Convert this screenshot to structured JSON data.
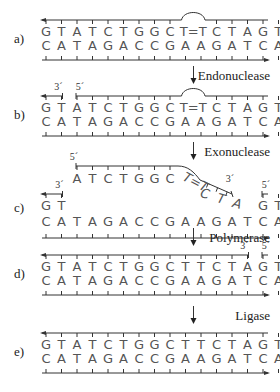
{
  "figure": {
    "column_start_x": 46,
    "column_spacing": 15.5,
    "colors": {
      "text": "#555555",
      "line": "#333333",
      "label": "#222222"
    },
    "panels": [
      {
        "id": "a",
        "label": "a)",
        "y_top": 20,
        "top_strand": [
          "G",
          "T",
          "A",
          "T",
          "C",
          "T",
          "G",
          "G",
          "C",
          "T",
          "T",
          "C",
          "T",
          "A",
          "G",
          "T"
        ],
        "top_display": "G T A T C T G G C T=T C T A G T",
        "bottom_strand": [
          "C",
          "A",
          "T",
          "A",
          "G",
          "A",
          "C",
          "C",
          "G",
          "A",
          "A",
          "G",
          "A",
          "T",
          "C",
          "A"
        ],
        "dimer": {
          "between_columns": [
            9,
            10
          ],
          "text": "T=T"
        },
        "top_nicks": [],
        "end_labels": []
      },
      {
        "id": "b",
        "label": "b)",
        "y_top": 96,
        "top_strand": [
          "G",
          "T",
          "A",
          "T",
          "C",
          "T",
          "G",
          "G",
          "C",
          "T",
          "T",
          "C",
          "T",
          "A",
          "G",
          "T"
        ],
        "bottom_strand": [
          "C",
          "A",
          "T",
          "A",
          "G",
          "A",
          "C",
          "C",
          "G",
          "A",
          "A",
          "G",
          "A",
          "T",
          "C",
          "A"
        ],
        "dimer": {
          "between_columns": [
            9,
            10
          ],
          "text": "T=T"
        },
        "top_nicks": [
          {
            "after_column": 1
          }
        ],
        "end_labels": [
          {
            "text": "3´",
            "column": 1
          },
          {
            "text": "5´",
            "column": 2
          }
        ]
      },
      {
        "id": "c",
        "label": "c)",
        "excised_fragment": {
          "five_prime_label": "5´",
          "flat_bases": [
            "A",
            "T",
            "C",
            "T",
            "G",
            "G",
            "C"
          ],
          "dimer_text": "T=T",
          "sloped_bases": [
            "C",
            "T",
            "A"
          ],
          "three_prime_label": "3´"
        },
        "remaining_left": {
          "bases": [
            "G",
            "T"
          ],
          "label": "3´"
        },
        "remaining_right": {
          "bases": [
            "G",
            "T"
          ],
          "label": "5´"
        },
        "bottom_strand": [
          "C",
          "A",
          "T",
          "A",
          "G",
          "A",
          "C",
          "C",
          "G",
          "A",
          "A",
          "G",
          "A",
          "T",
          "C",
          "A"
        ]
      },
      {
        "id": "d",
        "label": "d)",
        "y_top": 255,
        "top_strand": [
          "G",
          "T",
          "A",
          "T",
          "C",
          "T",
          "G",
          "G",
          "C",
          "T",
          "T",
          "C",
          "T",
          "A",
          "G",
          "T"
        ],
        "bottom_strand": [
          "C",
          "A",
          "T",
          "A",
          "G",
          "A",
          "C",
          "C",
          "G",
          "A",
          "A",
          "G",
          "A",
          "T",
          "C",
          "A"
        ],
        "top_nicks": [
          {
            "after_column": 13
          }
        ],
        "end_labels": [
          {
            "text": "3´",
            "column": 13
          },
          {
            "text": "5´",
            "column": 14
          }
        ]
      },
      {
        "id": "e",
        "label": "e)",
        "y_top": 333,
        "top_strand": [
          "G",
          "T",
          "A",
          "T",
          "C",
          "T",
          "G",
          "G",
          "C",
          "T",
          "T",
          "C",
          "T",
          "A",
          "G",
          "T"
        ],
        "bottom_strand": [
          "C",
          "A",
          "T",
          "A",
          "G",
          "A",
          "C",
          "C",
          "G",
          "A",
          "A",
          "G",
          "A",
          "T",
          "C",
          "A"
        ],
        "top_nicks": [],
        "end_labels": []
      }
    ],
    "steps": [
      {
        "label": "Endonuclease",
        "arrow_y": [
          66,
          84
        ],
        "label_y": 80
      },
      {
        "label": "Exonuclease",
        "arrow_y": [
          142,
          160
        ],
        "label_y": 156
      },
      {
        "label": "Polymerase",
        "arrow_y": [
          228,
          246
        ],
        "label_y": 242
      },
      {
        "label": "Ligase",
        "arrow_y": [
          306,
          324
        ],
        "label_y": 320
      }
    ]
  }
}
